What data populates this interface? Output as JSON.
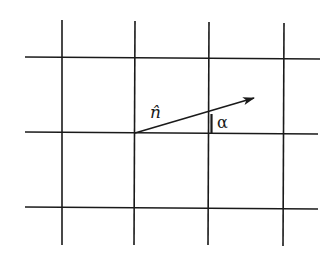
{
  "diagram": {
    "grid": {
      "vertical_lines_x": [
        62,
        135,
        209,
        284
      ],
      "vertical_extent": [
        20,
        245
      ],
      "horizontal_lines_y": [
        58,
        133,
        208
      ],
      "horizontal_extent": [
        25,
        319
      ]
    },
    "vector": {
      "label": "n̂",
      "from": [
        135,
        133
      ],
      "to": [
        254,
        98
      ]
    },
    "angle": {
      "label": "α",
      "vertex_line_x": 209
    },
    "colors": {
      "line": "#1a1a1a",
      "background": "#ffffff"
    }
  }
}
